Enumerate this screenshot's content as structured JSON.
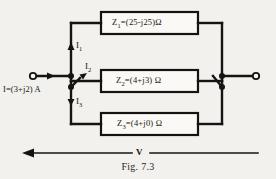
{
  "figure": {
    "caption": "Fig. 7.3",
    "bleed_through_text": "",
    "ink_color": "#161412",
    "paper_color": "#f2f1ee"
  },
  "source": {
    "label": "I=(3+j2) A",
    "terminal_name": "input-terminal"
  },
  "output": {
    "terminal_name": "output-terminal"
  },
  "branches": [
    {
      "id": "branch-1",
      "current_label": "I",
      "current_sub": "1",
      "impedance_symbol": "Z",
      "impedance_sub": "1",
      "impedance_value": "=(25-j25)",
      "unit": "Ω",
      "full_label": "Z1 =(25-j25) Ω"
    },
    {
      "id": "branch-2",
      "current_label": "I",
      "current_sub": "2",
      "impedance_symbol": "Z",
      "impedance_sub": "2",
      "impedance_value": "=(4+j3)",
      "unit": "Ω",
      "full_label": "Z2 =(4+j3) Ω"
    },
    {
      "id": "branch-3",
      "current_label": "I",
      "current_sub": "3",
      "impedance_symbol": "Z",
      "impedance_sub": "3",
      "impedance_value": "=(4+j0)",
      "unit": "Ω",
      "full_label": "Z3 =(4+j0) Ω"
    }
  ],
  "voltage": {
    "label": "V",
    "direction": "leftward"
  }
}
